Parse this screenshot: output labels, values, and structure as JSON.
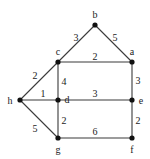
{
  "graph": {
    "nodes": [
      {
        "id": "b",
        "label": "b",
        "x": 95,
        "y": 25,
        "lx": 95,
        "ly": 18
      },
      {
        "id": "c",
        "label": "c",
        "x": 58,
        "y": 62,
        "lx": 58,
        "ly": 55
      },
      {
        "id": "a",
        "label": "a",
        "x": 132,
        "y": 62,
        "lx": 132,
        "ly": 55
      },
      {
        "id": "h",
        "label": "h",
        "x": 20,
        "y": 100,
        "lx": 10,
        "ly": 104
      },
      {
        "id": "d",
        "label": "d",
        "x": 58,
        "y": 100,
        "lx": 67,
        "ly": 103
      },
      {
        "id": "e",
        "label": "e",
        "x": 132,
        "y": 100,
        "lx": 141,
        "ly": 104
      },
      {
        "id": "g",
        "label": "g",
        "x": 58,
        "y": 138,
        "lx": 58,
        "ly": 153
      },
      {
        "id": "f",
        "label": "f",
        "x": 132,
        "y": 138,
        "lx": 132,
        "ly": 153
      }
    ],
    "edges": [
      {
        "from": "c",
        "to": "b",
        "weight": "3",
        "lx": 76,
        "ly": 41
      },
      {
        "from": "b",
        "to": "a",
        "weight": "5",
        "lx": 115,
        "ly": 41
      },
      {
        "from": "c",
        "to": "a",
        "weight": "2",
        "lx": 95,
        "ly": 60
      },
      {
        "from": "h",
        "to": "c",
        "weight": "2",
        "lx": 35,
        "ly": 79
      },
      {
        "from": "c",
        "to": "d",
        "weight": "4",
        "lx": 64,
        "ly": 85
      },
      {
        "from": "a",
        "to": "e",
        "weight": "3",
        "lx": 138,
        "ly": 84
      },
      {
        "from": "h",
        "to": "d",
        "weight": "1",
        "lx": 43,
        "ly": 97
      },
      {
        "from": "d",
        "to": "e",
        "weight": "3",
        "lx": 95,
        "ly": 97
      },
      {
        "from": "h",
        "to": "g",
        "weight": "5",
        "lx": 35,
        "ly": 132
      },
      {
        "from": "d",
        "to": "g",
        "weight": "2",
        "lx": 64,
        "ly": 124
      },
      {
        "from": "e",
        "to": "f",
        "weight": "2",
        "lx": 138,
        "ly": 124
      },
      {
        "from": "g",
        "to": "f",
        "weight": "6",
        "lx": 95,
        "ly": 135
      }
    ]
  }
}
